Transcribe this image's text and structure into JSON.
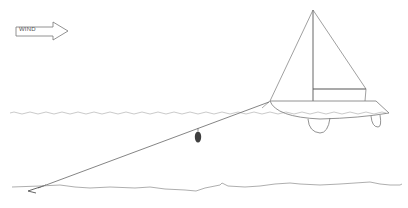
{
  "diagram": {
    "wind_arrow": {
      "label": "WIND",
      "direction": "right"
    },
    "elements": [
      "wind-arrow",
      "sailboat",
      "water-surface",
      "anchor-rode",
      "kellet-weight",
      "anchor",
      "seabed"
    ],
    "colors": {
      "line": "#777777",
      "dark_line": "#555555",
      "water": "#bbbbbb",
      "weight": "#444444",
      "background": "#ffffff"
    }
  }
}
